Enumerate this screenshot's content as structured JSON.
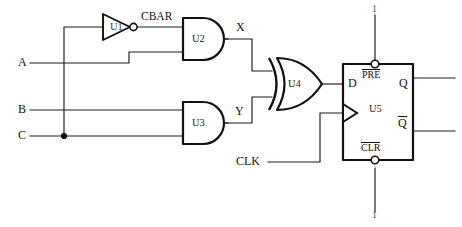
{
  "diagram": {
    "type": "digital-logic-schematic"
  },
  "inputs": [
    {
      "name": "input-a",
      "label": "A"
    },
    {
      "name": "input-b",
      "label": "B"
    },
    {
      "name": "input-c",
      "label": "C"
    },
    {
      "name": "input-clk",
      "label": "CLK"
    }
  ],
  "gates": [
    {
      "name": "inverter-u1",
      "label": "U1",
      "kind": "NOT"
    },
    {
      "name": "and-gate-u2",
      "label": "U2",
      "kind": "AND"
    },
    {
      "name": "and-gate-u3",
      "label": "U3",
      "kind": "AND"
    },
    {
      "name": "xor-gate-u4",
      "label": "U4",
      "kind": "XOR"
    },
    {
      "name": "flip-flop-u5",
      "label": "U5",
      "kind": "D-FLIP-FLOP"
    }
  ],
  "nets": [
    {
      "name": "net-cbar",
      "label": "CBAR"
    },
    {
      "name": "net-x",
      "label": "X"
    },
    {
      "name": "net-y",
      "label": "Y"
    }
  ],
  "flipflop": {
    "d_label": "D",
    "q_label": "Q",
    "qbar_label": "Q",
    "pre_label": "PRE",
    "clr_label": "CLR",
    "body_label": "U5",
    "pre_tie_label": "1",
    "clr_tie_label": "1"
  },
  "colors": {
    "wire": "#1a1a1a",
    "gate_outline": "#111111",
    "background": "#ffffff"
  }
}
